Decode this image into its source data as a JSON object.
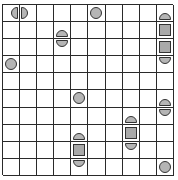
{
  "board": {
    "rows": 10,
    "cols": 10,
    "colors": {
      "grid_line": "#2a2a2a",
      "cell_bg": "#ffffff",
      "piece_fill": "#b5b5b5",
      "piece_stroke": "#333333"
    },
    "pieces": [
      {
        "row": 0,
        "col": 0,
        "shape": "half-left"
      },
      {
        "row": 0,
        "col": 1,
        "shape": "half-right"
      },
      {
        "row": 0,
        "col": 5,
        "shape": "circle"
      },
      {
        "row": 0,
        "col": 9,
        "shape": "half-up"
      },
      {
        "row": 1,
        "col": 3,
        "shape": "half-up"
      },
      {
        "row": 1,
        "col": 9,
        "shape": "square"
      },
      {
        "row": 2,
        "col": 3,
        "shape": "half-down"
      },
      {
        "row": 2,
        "col": 9,
        "shape": "square"
      },
      {
        "row": 3,
        "col": 0,
        "shape": "circle"
      },
      {
        "row": 3,
        "col": 9,
        "shape": "half-down"
      },
      {
        "row": 5,
        "col": 4,
        "shape": "circle"
      },
      {
        "row": 5,
        "col": 9,
        "shape": "half-up"
      },
      {
        "row": 6,
        "col": 7,
        "shape": "half-up"
      },
      {
        "row": 6,
        "col": 9,
        "shape": "half-down"
      },
      {
        "row": 7,
        "col": 4,
        "shape": "half-up"
      },
      {
        "row": 7,
        "col": 7,
        "shape": "square"
      },
      {
        "row": 8,
        "col": 4,
        "shape": "square"
      },
      {
        "row": 8,
        "col": 7,
        "shape": "half-down"
      },
      {
        "row": 9,
        "col": 4,
        "shape": "half-down"
      },
      {
        "row": 9,
        "col": 9,
        "shape": "circle"
      }
    ]
  }
}
